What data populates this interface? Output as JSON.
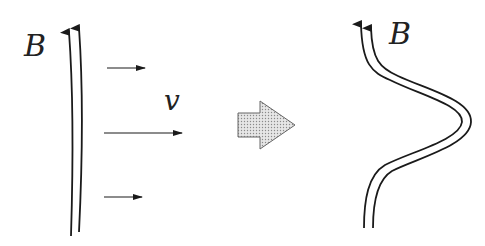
{
  "diagram": {
    "left_panel": {
      "field_label": "B",
      "velocity_label": "v",
      "description": "Straight magnetic field lines with uniform flow velocity arrows"
    },
    "transition": {
      "icon": "dotted-right-arrow"
    },
    "right_panel": {
      "field_label": "B",
      "description": "Magnetic field lines bent by flow (frozen-in field)"
    },
    "colors": {
      "line": "#1a1a1a",
      "arrow_fill": "#d8d8d8",
      "arrow_stroke": "#555555",
      "background": "#ffffff"
    }
  }
}
